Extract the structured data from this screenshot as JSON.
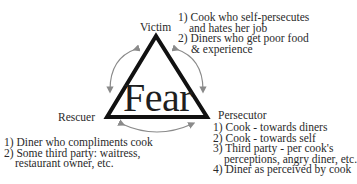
{
  "diagram": {
    "center_label": "Fear",
    "vertices": {
      "top": {
        "label": "Victim",
        "items": [
          {
            "num": "1)",
            "lines": [
              "Cook who self-persecutes",
              "and hates her job"
            ]
          },
          {
            "num": "2)",
            "lines": [
              "Diners who get poor food",
              "& experience"
            ]
          }
        ]
      },
      "left": {
        "label": "Rescuer",
        "items": [
          {
            "num": "1)",
            "lines": [
              "Diner who compliments cook"
            ]
          },
          {
            "num": "2)",
            "lines": [
              "Some third party: waitress,",
              "restaurant owner, etc."
            ]
          }
        ]
      },
      "right": {
        "label": "Persecutor",
        "items": [
          {
            "num": "1)",
            "lines": [
              "Cook - towards diners"
            ]
          },
          {
            "num": "2)",
            "lines": [
              "Cook - towards self"
            ]
          },
          {
            "num": "3)",
            "lines": [
              "Third party - per cook's",
              "perceptions, angry diner, etc."
            ]
          },
          {
            "num": "4)",
            "lines": [
              "Diner as perceived by cook"
            ]
          }
        ]
      }
    },
    "colors": {
      "triangle": "#111111",
      "arrows": "#8a8a8a",
      "text": "#2a2a2a"
    }
  }
}
